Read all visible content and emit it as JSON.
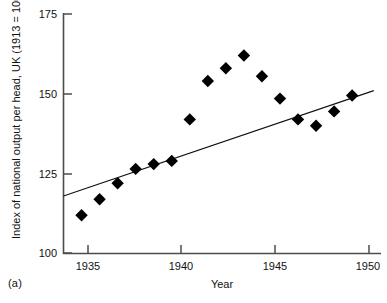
{
  "figure": {
    "panel_label": "(a)",
    "background": "#ffffff",
    "axis_color": "#4c4c4c",
    "marker_color": "#000000",
    "trend_color": "#111111"
  },
  "chart_data": {
    "type": "scatter",
    "title": "",
    "subtitle": "",
    "xlabel": "Year",
    "ylabel": "Index of national output per head, UK (1913 = 100)",
    "xlim": [
      1933,
      1950.6
    ],
    "ylim": [
      100,
      175
    ],
    "xticks": [
      1935,
      1940,
      1945,
      1950
    ],
    "xtick_labels": [
      "1935",
      "1940",
      "1945",
      "1950"
    ],
    "yticks": [
      100,
      125,
      150,
      175
    ],
    "ytick_labels": [
      "100",
      "125",
      "150",
      "175"
    ],
    "grid": false,
    "legend": false,
    "legend_position": "none",
    "marker": "diamond",
    "x": [
      1934,
      1935,
      1936,
      1937,
      1938,
      1939,
      1940,
      1941,
      1942,
      1943,
      1944,
      1945,
      1946,
      1947,
      1948,
      1949
    ],
    "y": [
      112,
      117,
      122,
      126.5,
      128,
      129,
      142,
      154,
      158,
      162,
      155.5,
      148.5,
      142,
      140,
      144.5,
      149.5
    ],
    "series": [
      {
        "name": "Index of national output per head",
        "x": [
          1934,
          1935,
          1936,
          1937,
          1938,
          1939,
          1940,
          1941,
          1942,
          1943,
          1944,
          1945,
          1946,
          1947,
          1948,
          1949
        ],
        "values": [
          112,
          117,
          122,
          126.5,
          128,
          129,
          142,
          154,
          158,
          162,
          155.5,
          148.5,
          142,
          140,
          144.5,
          149.5
        ]
      }
    ],
    "trendline": {
      "type": "linear",
      "x_start": 1933,
      "y_start": 118,
      "x_end": 1950.2,
      "y_end": 151
    },
    "annotations": []
  }
}
